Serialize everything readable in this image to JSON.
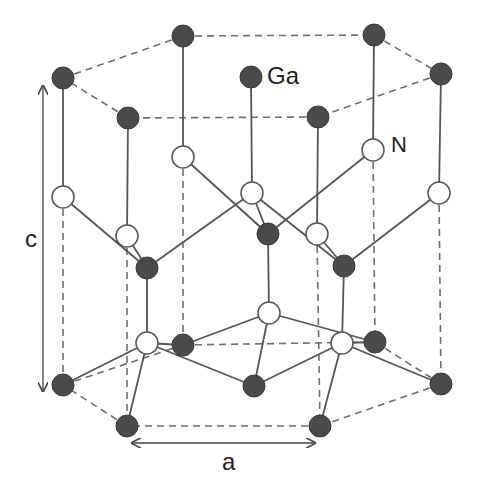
{
  "colors": {
    "ga_fill": "#4a4a4a",
    "n_fill": "#ffffff",
    "n_stroke": "#555555",
    "bond": "#555555",
    "dashed": "#6e6e6e",
    "arrow": "#444444"
  },
  "labels": {
    "ga": "Ga",
    "n": "N",
    "c": "c",
    "a": "a"
  },
  "atoms": {
    "ga": [
      {
        "id": "ga-top-left",
        "p": [
          63,
          78
        ]
      },
      {
        "id": "ga-top-back-left",
        "p": [
          183,
          36
        ]
      },
      {
        "id": "ga-top-back-right",
        "p": [
          374,
          35
        ]
      },
      {
        "id": "ga-top-right",
        "p": [
          441,
          74
        ]
      },
      {
        "id": "ga-top-front-right",
        "p": [
          318,
          117
        ]
      },
      {
        "id": "ga-top-front-left",
        "p": [
          128,
          118
        ]
      },
      {
        "id": "ga-top-center",
        "p": [
          251,
          77
        ]
      },
      {
        "id": "ga-mid-left",
        "p": [
          147,
          268
        ]
      },
      {
        "id": "ga-mid-center",
        "p": [
          268,
          234
        ]
      },
      {
        "id": "ga-mid-right",
        "p": [
          344,
          266
        ]
      },
      {
        "id": "ga-bot-left",
        "p": [
          63,
          385
        ]
      },
      {
        "id": "ga-bot-back-left",
        "p": [
          183,
          345
        ]
      },
      {
        "id": "ga-bot-back-right",
        "p": [
          375,
          342
        ]
      },
      {
        "id": "ga-bot-right",
        "p": [
          441,
          384
        ]
      },
      {
        "id": "ga-bot-front-right",
        "p": [
          320,
          426
        ]
      },
      {
        "id": "ga-bot-front-left",
        "p": [
          127,
          426
        ]
      },
      {
        "id": "ga-bot-center",
        "p": [
          254,
          386
        ]
      }
    ],
    "n": [
      {
        "id": "n-upper-left",
        "p": [
          63,
          197
        ]
      },
      {
        "id": "n-upper-back-left",
        "p": [
          183,
          157
        ]
      },
      {
        "id": "n-upper-back-right",
        "p": [
          373,
          150
        ]
      },
      {
        "id": "n-upper-right",
        "p": [
          439,
          193
        ]
      },
      {
        "id": "n-upper-front-right",
        "p": [
          317,
          234
        ]
      },
      {
        "id": "n-upper-front-left",
        "p": [
          127,
          236
        ]
      },
      {
        "id": "n-upper-center",
        "p": [
          252,
          193
        ]
      },
      {
        "id": "n-lower-left",
        "p": [
          147,
          343
        ]
      },
      {
        "id": "n-lower-center",
        "p": [
          269,
          313
        ]
      },
      {
        "id": "n-lower-right",
        "p": [
          342,
          343
        ]
      }
    ]
  },
  "bonds": [
    [
      [
        63,
        78
      ],
      [
        63,
        197
      ]
    ],
    [
      [
        183,
        36
      ],
      [
        183,
        157
      ]
    ],
    [
      [
        374,
        35
      ],
      [
        373,
        150
      ]
    ],
    [
      [
        441,
        74
      ],
      [
        439,
        193
      ]
    ],
    [
      [
        318,
        117
      ],
      [
        317,
        234
      ]
    ],
    [
      [
        128,
        118
      ],
      [
        127,
        236
      ]
    ],
    [
      [
        251,
        77
      ],
      [
        252,
        193
      ]
    ],
    [
      [
        63,
        197
      ],
      [
        147,
        268
      ]
    ],
    [
      [
        127,
        236
      ],
      [
        147,
        268
      ]
    ],
    [
      [
        147,
        268
      ],
      [
        252,
        193
      ]
    ],
    [
      [
        183,
        157
      ],
      [
        268,
        234
      ]
    ],
    [
      [
        252,
        193
      ],
      [
        268,
        234
      ]
    ],
    [
      [
        373,
        150
      ],
      [
        268,
        234
      ]
    ],
    [
      [
        252,
        193
      ],
      [
        344,
        266
      ]
    ],
    [
      [
        317,
        234
      ],
      [
        344,
        266
      ]
    ],
    [
      [
        439,
        193
      ],
      [
        344,
        266
      ]
    ],
    [
      [
        147,
        268
      ],
      [
        147,
        343
      ]
    ],
    [
      [
        268,
        234
      ],
      [
        269,
        313
      ]
    ],
    [
      [
        344,
        266
      ],
      [
        342,
        343
      ]
    ],
    [
      [
        147,
        343
      ],
      [
        63,
        385
      ]
    ],
    [
      [
        147,
        343
      ],
      [
        127,
        426
      ]
    ],
    [
      [
        147,
        343
      ],
      [
        183,
        345
      ]
    ],
    [
      [
        147,
        343
      ],
      [
        254,
        386
      ]
    ],
    [
      [
        183,
        345
      ],
      [
        269,
        313
      ]
    ],
    [
      [
        269,
        313
      ],
      [
        254,
        386
      ]
    ],
    [
      [
        269,
        313
      ],
      [
        375,
        342
      ]
    ],
    [
      [
        342,
        343
      ],
      [
        375,
        342
      ]
    ],
    [
      [
        342,
        343
      ],
      [
        441,
        384
      ]
    ],
    [
      [
        342,
        343
      ],
      [
        320,
        426
      ]
    ],
    [
      [
        342,
        343
      ],
      [
        254,
        386
      ]
    ]
  ],
  "dashed": [
    [
      [
        63,
        78
      ],
      [
        183,
        36
      ]
    ],
    [
      [
        183,
        36
      ],
      [
        374,
        35
      ]
    ],
    [
      [
        374,
        35
      ],
      [
        441,
        74
      ]
    ],
    [
      [
        441,
        74
      ],
      [
        318,
        117
      ]
    ],
    [
      [
        318,
        117
      ],
      [
        128,
        118
      ]
    ],
    [
      [
        128,
        118
      ],
      [
        63,
        78
      ]
    ],
    [
      [
        63,
        197
      ],
      [
        63,
        385
      ]
    ],
    [
      [
        127,
        236
      ],
      [
        127,
        426
      ]
    ],
    [
      [
        183,
        157
      ],
      [
        183,
        345
      ]
    ],
    [
      [
        317,
        234
      ],
      [
        320,
        426
      ]
    ],
    [
      [
        373,
        150
      ],
      [
        375,
        342
      ]
    ],
    [
      [
        439,
        193
      ],
      [
        441,
        384
      ]
    ],
    [
      [
        63,
        385
      ],
      [
        183,
        345
      ]
    ],
    [
      [
        183,
        345
      ],
      [
        375,
        342
      ]
    ],
    [
      [
        375,
        342
      ],
      [
        441,
        384
      ]
    ],
    [
      [
        441,
        384
      ],
      [
        320,
        426
      ]
    ],
    [
      [
        320,
        426
      ],
      [
        127,
        426
      ]
    ],
    [
      [
        127,
        426
      ],
      [
        63,
        385
      ]
    ]
  ]
}
